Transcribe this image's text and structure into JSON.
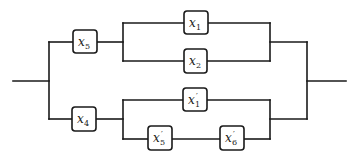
{
  "diagram": {
    "type": "series-parallel reliability block diagram",
    "components": [
      {
        "id": "x5",
        "var": "x",
        "sub": "5",
        "prime": ""
      },
      {
        "id": "x4",
        "var": "x",
        "sub": "4",
        "prime": ""
      },
      {
        "id": "x1",
        "var": "x",
        "sub": "1",
        "prime": ""
      },
      {
        "id": "x2",
        "var": "x",
        "sub": "2",
        "prime": ""
      },
      {
        "id": "x1p",
        "var": "x",
        "sub": "1",
        "prime": "′"
      },
      {
        "id": "x5p",
        "var": "x",
        "sub": "5",
        "prime": "′"
      },
      {
        "id": "x6p",
        "var": "x",
        "sub": "6",
        "prime": "′"
      }
    ],
    "structure": "parallel( series(x5, parallel(x1, x2)), series(x4, parallel(x1', series(x5', x6'))) )"
  }
}
